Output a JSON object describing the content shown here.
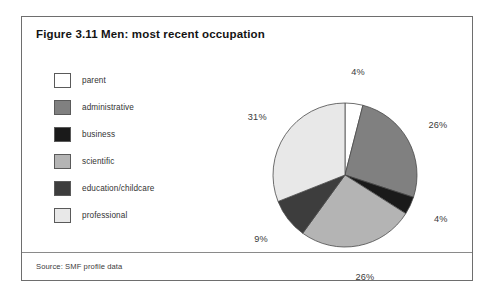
{
  "figure": {
    "title": "Figure 3.11 Men: most recent occupation",
    "source": "Source: SMF profile data"
  },
  "legend": {
    "items": [
      {
        "label": "parent",
        "color": "#ffffff"
      },
      {
        "label": "administrative",
        "color": "#808080"
      },
      {
        "label": "business",
        "color": "#1a1a1a"
      },
      {
        "label": "scientific",
        "color": "#b4b4b4"
      },
      {
        "label": "education/childcare",
        "color": "#3d3d3d"
      },
      {
        "label": "professional",
        "color": "#e8e8e8"
      }
    ]
  },
  "chart_data": {
    "type": "pie",
    "title": "Figure 3.11 Men: most recent occupation",
    "categories": [
      "parent",
      "administrative",
      "business",
      "scientific",
      "education/childcare",
      "professional"
    ],
    "values": [
      4,
      26,
      4,
      26,
      9,
      31
    ],
    "labels": [
      "4%",
      "26%",
      "4%",
      "26%",
      "9%",
      "31%"
    ],
    "colors": [
      "#ffffff",
      "#808080",
      "#1a1a1a",
      "#b4b4b4",
      "#3d3d3d",
      "#e8e8e8"
    ],
    "units": "percent",
    "total": 100,
    "start_angle": 0,
    "direction": "clockwise",
    "legend_position": "left",
    "grid": false
  }
}
